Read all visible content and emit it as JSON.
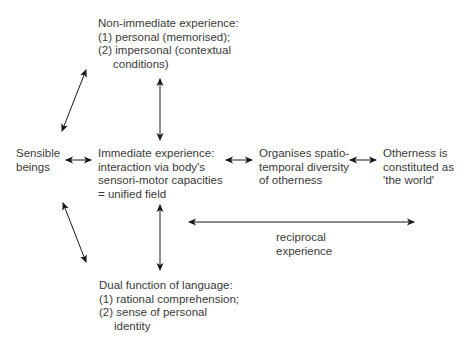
{
  "diagram": {
    "nodes": {
      "non_immediate": {
        "lines": [
          "Non-immediate experience:",
          "(1) personal (memorised);",
          "(2) impersonal (contextual",
          "conditions)"
        ]
      },
      "sensible_beings": {
        "lines": [
          "Sensible",
          "beings"
        ]
      },
      "immediate": {
        "lines": [
          "Immediate experience:",
          "interaction via body's",
          "sensori-motor capacities",
          "= unified field"
        ]
      },
      "organises": {
        "lines": [
          "Organises spatio-",
          "temporal diversity",
          "of otherness"
        ]
      },
      "otherness": {
        "lines": [
          "Otherness is",
          "constituted as",
          "'the world'"
        ]
      },
      "reciprocal": {
        "lines": [
          "reciprocal",
          "experience"
        ]
      },
      "language": {
        "lines": [
          "Dual function of language:",
          "(1) rational comprehension;",
          "(2) sense of personal",
          "identity"
        ]
      }
    },
    "edges": [
      {
        "from": "sensible_beings",
        "to": "non_immediate",
        "type": "bidirectional"
      },
      {
        "from": "non_immediate",
        "to": "immediate",
        "type": "bidirectional"
      },
      {
        "from": "sensible_beings",
        "to": "immediate",
        "type": "bidirectional"
      },
      {
        "from": "immediate",
        "to": "organises",
        "type": "bidirectional"
      },
      {
        "from": "organises",
        "to": "otherness",
        "type": "bidirectional"
      },
      {
        "from": "immediate",
        "to": "language",
        "type": "bidirectional"
      },
      {
        "from": "sensible_beings",
        "to": "language",
        "type": "bidirectional"
      },
      {
        "from": "reciprocal_left",
        "to": "reciprocal_right",
        "type": "bidirectional",
        "label": "reciprocal experience"
      }
    ],
    "colors": {
      "text": "#3a3a3a",
      "arrow": "#1a1a1a",
      "background": "#ffffff"
    }
  }
}
